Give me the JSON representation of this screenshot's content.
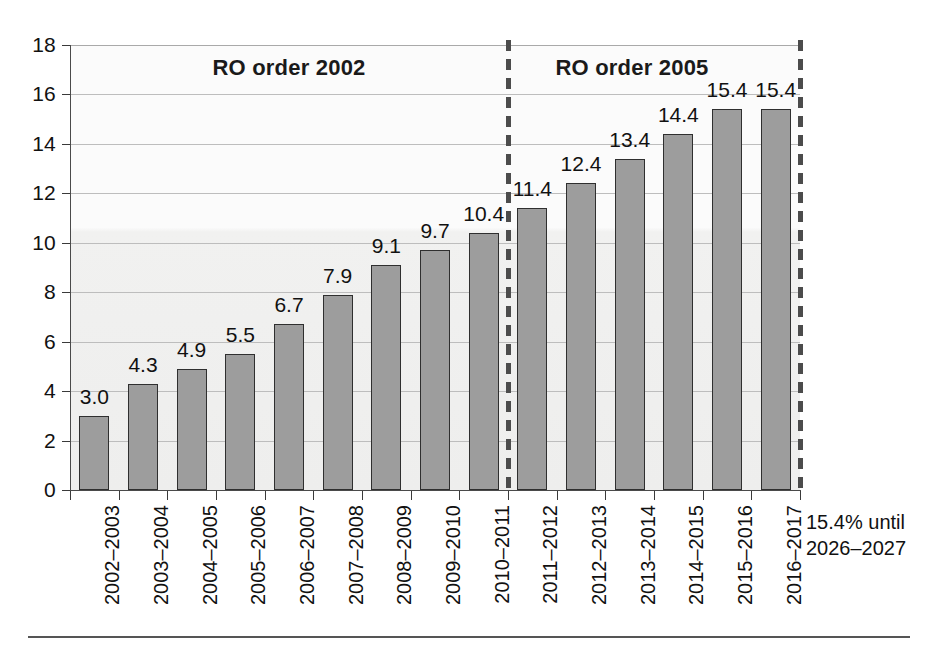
{
  "chart_data": {
    "type": "bar",
    "title": "",
    "xlabel": "",
    "ylabel": "",
    "ylim": [
      0,
      18
    ],
    "ytick_step": 2,
    "ytick_labels": [
      "0",
      "2",
      "4",
      "6",
      "8",
      "10",
      "12",
      "14",
      "16",
      "18"
    ],
    "grid": true,
    "legend": "none",
    "categories": [
      "2002–2003",
      "2003–2004",
      "2004–2005",
      "2005–2006",
      "2006–2007",
      "2007–2008",
      "2008–2009",
      "2009–2010",
      "2010–2011",
      "2011–2012",
      "2012–2013",
      "2013–2014",
      "2014–2015",
      "2015–2016",
      "2016–2017"
    ],
    "values": [
      3.0,
      4.3,
      4.9,
      5.5,
      6.7,
      7.9,
      9.1,
      9.7,
      10.4,
      11.4,
      12.4,
      13.4,
      14.4,
      15.4,
      15.4
    ],
    "data_labels": [
      "3.0",
      "4.3",
      "4.9",
      "5.5",
      "6.7",
      "7.9",
      "9.1",
      "9.7",
      "10.4",
      "11.4",
      "12.4",
      "13.4",
      "14.4",
      "15.4",
      "15.4"
    ],
    "bar_color": "#9d9d9d",
    "bar_edge_color": "#2f2f2f",
    "plot_background": "#f2f2f1",
    "gridline_color": "#bdbdbd",
    "annotations": [
      {
        "name": "section-title-1",
        "text": "RO order 2002",
        "x_span": [
          "2002–2003",
          "2010–2011"
        ]
      },
      {
        "name": "section-title-2",
        "text": "RO order 2005",
        "x_span": [
          "2011–2012",
          "2016–2017"
        ]
      },
      {
        "name": "plateau-note",
        "line1": "15.4% until",
        "line2": "2026–2027"
      }
    ],
    "dividers": [
      {
        "name": "divider-2002-2005",
        "after_category": "2010–2011",
        "style": "dashed"
      },
      {
        "name": "divider-right-edge",
        "after_category": "2016–2017",
        "style": "dashed"
      }
    ]
  },
  "sections": {
    "first": {
      "label": "RO order 2002"
    },
    "second": {
      "label": "RO order 2005"
    }
  },
  "note": {
    "line1": "15.4% until",
    "line2": "2026–2027"
  }
}
